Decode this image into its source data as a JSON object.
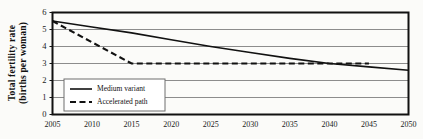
{
  "chart_data": {
    "type": "line",
    "title": "",
    "xlabel": "",
    "ylabel": "Total fertility rate (births per woman)",
    "ylabel_line1": "Total fertility rate",
    "ylabel_line2": "(births per woman)",
    "xlim": [
      2005,
      2050
    ],
    "ylim": [
      0,
      6
    ],
    "grid": true,
    "legend_position": "inside-lower-left",
    "xticks": [
      2005,
      2010,
      2015,
      2020,
      2025,
      2030,
      2035,
      2040,
      2045,
      2050
    ],
    "yticks": [
      0,
      1,
      2,
      3,
      4,
      5,
      6
    ],
    "x": [
      2005,
      2010,
      2015,
      2020,
      2025,
      2030,
      2035,
      2040,
      2045,
      2050
    ],
    "series": [
      {
        "name": "Medium variant",
        "style": "solid",
        "color": "#111111",
        "values": [
          5.5,
          5.15,
          4.8,
          4.4,
          4.0,
          3.65,
          3.3,
          3.0,
          2.8,
          2.6
        ]
      },
      {
        "name": "Accelerated path",
        "style": "dashed",
        "color": "#111111",
        "values": [
          5.5,
          4.25,
          3.0,
          3.0,
          3.0,
          3.0,
          3.0,
          3.0,
          3.0,
          null
        ]
      }
    ],
    "colors": {
      "background": "#fbfbf9",
      "gridline": "#8c8c8c",
      "axis": "#111111",
      "text": "#1a1a1a"
    }
  },
  "legend": {
    "items": [
      {
        "label": "Medium variant",
        "style": "solid"
      },
      {
        "label": "Accelerated path",
        "style": "dashed"
      }
    ]
  }
}
